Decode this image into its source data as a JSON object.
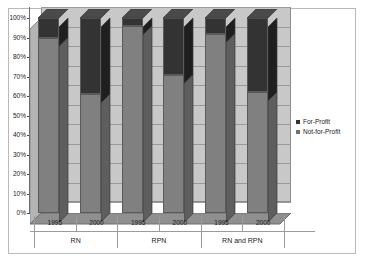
{
  "chart_data": {
    "type": "bar",
    "title": "",
    "subtitle": "",
    "xlabel": "",
    "ylabel": "",
    "stacked": true,
    "three_d": true,
    "grid": true,
    "legend_position": "right",
    "ylim": [
      0,
      100
    ],
    "y_tick_labels": [
      "100%",
      "90%",
      "80%",
      "70%",
      "60%",
      "50%",
      "40%",
      "30%",
      "20%",
      "10%",
      "0%"
    ],
    "y_tick_values": [
      100,
      90,
      80,
      70,
      60,
      50,
      40,
      30,
      20,
      10,
      0
    ],
    "categories": [
      "1995",
      "2000",
      "1995",
      "2000",
      "1995",
      "2000"
    ],
    "groups": [
      {
        "label": "RN",
        "categories": [
          "1995",
          "2000"
        ]
      },
      {
        "label": "RPN",
        "categories": [
          "1995",
          "2000"
        ]
      },
      {
        "label": "RN and RPN",
        "categories": [
          "1995",
          "2000"
        ]
      }
    ],
    "series": [
      {
        "name": "Not-for-Profit",
        "color": "#808080",
        "values": [
          90,
          61,
          96,
          71,
          92,
          62
        ]
      },
      {
        "name": "For-Profit",
        "color": "#333333",
        "values": [
          10,
          39,
          4,
          29,
          8,
          38
        ]
      }
    ]
  },
  "legend": {
    "items": [
      {
        "label": "For-Profit",
        "color": "#333333"
      },
      {
        "label": "Not-for-Profit",
        "color": "#707070"
      }
    ]
  }
}
